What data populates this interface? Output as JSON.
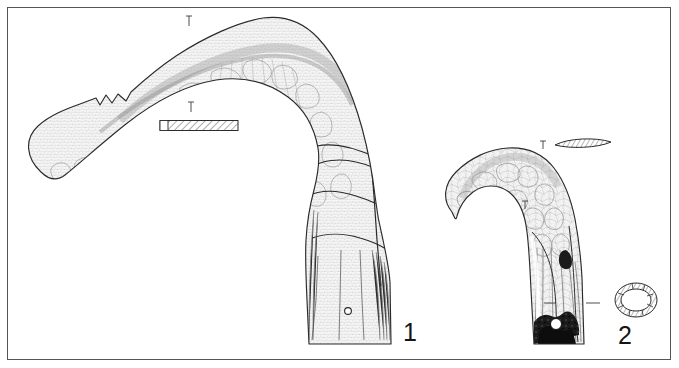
{
  "plate": {
    "kind": "archaeological-illustration-plate",
    "background_color": "#ffffff",
    "frame": {
      "present": true,
      "color": "#555555",
      "x": 7,
      "y": 7,
      "width": 664,
      "height": 353
    },
    "ink_color": "#1a1a1a",
    "shading_color": "#8d8d8d",
    "fill_color": "#f2f2f2",
    "dark_fill_color": "#111111"
  },
  "figures": [
    {
      "id": "figure-1",
      "number_label": "1",
      "number_position": {
        "x": 403,
        "y": 320
      },
      "description": "Large curved metal sickle-like blade with broad arched back, pointed notched tip at left, and a wide tapering tang/handle descending at right with a small circular rivet hole",
      "orientation": "arched, tip to the lower-left, handle to lower-right",
      "features": [
        "stippled and hatched corrosion patina over whole surface",
        "irregular crack lines across the bend and handle",
        "notch cut into the upper edge near the tip",
        "small round rivet hole in the lower handle"
      ],
      "rivet_hole": {
        "x": 348,
        "y": 311,
        "r": 3.2
      },
      "section_markers": [
        {
          "x": 189,
          "y": 18,
          "label": ""
        },
        {
          "x": 191,
          "y": 104,
          "label": ""
        }
      ],
      "cross_section": {
        "name": "blade-cross-section-1",
        "shape": "thin elongated rectangle, diagonally hatched",
        "x": 160,
        "y": 120,
        "width": 78,
        "height": 11
      }
    },
    {
      "id": "figure-2",
      "number_label": "2",
      "number_position": {
        "x": 618,
        "y": 323
      },
      "description": "Smaller hook-shaped metal blade with tightly curved crescent head and a straight socketed shaft below, heavily corroded and broken with dark patches at the base",
      "orientation": "hook curving to the left, socket shaft descending",
      "features": [
        "crazed / crackled corrosion texture across the crescent",
        "vertical striated shading along the shaft",
        "dark broken and corroded area at the foot of the socket"
      ],
      "section_markers": [
        {
          "x": 543,
          "y": 143,
          "label": ""
        },
        {
          "x": 525,
          "y": 203,
          "label": ""
        },
        {
          "x": 552,
          "y": 303,
          "label": ""
        },
        {
          "x": 597,
          "y": 303,
          "label": ""
        }
      ],
      "cross_sections": [
        {
          "name": "blade-cross-section-2",
          "shape": "lenticular lens, hatched",
          "x": 555,
          "y": 140,
          "width": 56,
          "height": 9
        },
        {
          "name": "socket-cross-section-2",
          "shape": "hollow ring / annulus, hatched wall",
          "cx": 636,
          "cy": 300,
          "rx": 21,
          "ry": 17
        }
      ]
    }
  ],
  "scale_bar": {
    "present": false,
    "label": ""
  },
  "captions": []
}
